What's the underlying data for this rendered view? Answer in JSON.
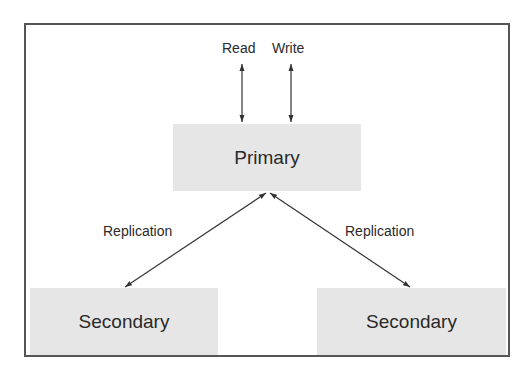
{
  "diagram": {
    "type": "replication-topology",
    "nodes": {
      "primary": {
        "label": "Primary"
      },
      "secondary_left": {
        "label": "Secondary"
      },
      "secondary_right": {
        "label": "Secondary"
      }
    },
    "io_labels": {
      "read": "Read",
      "write": "Write"
    },
    "edges": [
      {
        "from": "client",
        "to": "primary",
        "label": "Read",
        "direction": "bidirectional"
      },
      {
        "from": "client",
        "to": "primary",
        "label": "Write",
        "direction": "bidirectional"
      },
      {
        "from": "primary",
        "to": "secondary_left",
        "label": "Replication",
        "direction": "bidirectional"
      },
      {
        "from": "primary",
        "to": "secondary_right",
        "label": "Replication",
        "direction": "bidirectional"
      }
    ],
    "edge_labels": {
      "left": "Replication",
      "right": "Replication"
    },
    "colors": {
      "border": "#555555",
      "node_fill": "#e6e6e6",
      "text": "#2a2a2a",
      "arrow": "#333333"
    }
  }
}
